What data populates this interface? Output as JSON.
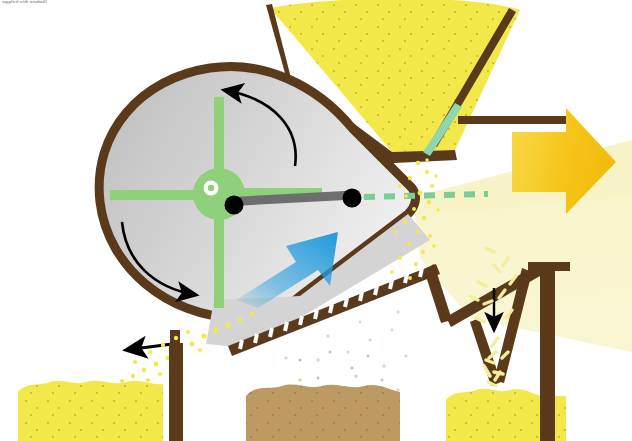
{
  "credit": {
    "text": "supplied with windmill"
  },
  "illustration": {
    "title": "Grain winnowing / threshing machine cutaway diagram",
    "background_color": "#ffffff"
  },
  "palette": {
    "frame_brown": "#5a3a1b",
    "grain_yellow": "#f2e84a",
    "grain_yellow_pale": "#f6f0a8",
    "chaff_tan": "#bd9a62",
    "drum_grey_light": "#dcdcdc",
    "drum_grey_dark": "#bdbdbd",
    "rotor_green": "#8ed17a",
    "chute_green": "#8fd6ae",
    "airflow_pale": "#f7f3c4",
    "arrow_gold": "#f5c518",
    "arrow_gold_light": "#f7d94a",
    "arrow_blue": "#2a9fe0",
    "arrow_black": "#000000",
    "shaft_grey": "#6e6e6e",
    "hub_white": "#ffffff"
  },
  "parts": [
    {
      "id": "fan-housing",
      "label": "Fan housing (drum)",
      "color": "#dcdcdc"
    },
    {
      "id": "fan-housing-rim",
      "label": "Fan housing rim",
      "color": "#5a3a1b"
    },
    {
      "id": "rotor",
      "label": "Four-blade fan rotor",
      "color": "#8ed17a"
    },
    {
      "id": "rotor-hub",
      "label": "Rotor hub",
      "color": "#8ed17a"
    },
    {
      "id": "drive-shaft",
      "label": "Drive shaft / connecting rod",
      "color": "#6e6e6e"
    },
    {
      "id": "grain-hopper",
      "label": "Grain feed hopper",
      "color": "#f2e84a"
    },
    {
      "id": "feed-chute",
      "label": "Feed chute",
      "color": "#8fd6ae"
    },
    {
      "id": "sieve",
      "label": "Oscillating sieve / screen",
      "color": "#5a3a1b"
    },
    {
      "id": "discharge-chute",
      "label": "V discharge chute",
      "color": "#5a3a1b"
    },
    {
      "id": "support-leg",
      "label": "Support leg",
      "color": "#5a3a1b"
    },
    {
      "id": "air-stream",
      "label": "Air stream from fan",
      "color": "#f7f3c4"
    },
    {
      "id": "pile-clean-grain-left",
      "label": "Clean grain pile",
      "color": "#f2e84a"
    },
    {
      "id": "pile-chaff-middle",
      "label": "Chaff / tailings pile",
      "color": "#bd9a62"
    },
    {
      "id": "pile-clean-grain-right",
      "label": "Straw / husk pile",
      "color": "#f2e84a"
    }
  ],
  "flow_arrows": [
    {
      "id": "airflow-arrow",
      "label": "Air flow out",
      "direction": "right",
      "color": "#f5c518"
    },
    {
      "id": "blower-arrow",
      "label": "Blower air",
      "direction": "up-right",
      "color": "#2a9fe0"
    },
    {
      "id": "rotation-arrow-top",
      "label": "Rotor turns (top)",
      "direction": "counter-clockwise",
      "color": "#000000"
    },
    {
      "id": "rotation-arrow-bottom",
      "label": "Rotor turns (bottom)",
      "direction": "counter-clockwise",
      "color": "#000000"
    },
    {
      "id": "light-grain-arrow",
      "label": "Light material out",
      "direction": "left",
      "color": "#000000"
    },
    {
      "id": "fall-arrow",
      "label": "Material falls",
      "direction": "down",
      "color": "#000000"
    },
    {
      "id": "axis-line",
      "label": "Shaft axis line",
      "direction": "right",
      "color": "#7dcb95"
    }
  ]
}
